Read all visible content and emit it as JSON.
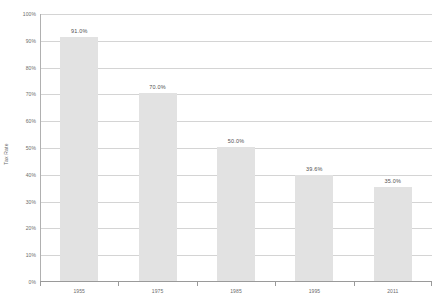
{
  "chart_data": {
    "type": "bar",
    "title": "",
    "subtitle": "",
    "xlabel": "",
    "ylabel": "Tax Rate",
    "categories": [
      "1955",
      "1975",
      "1985",
      "1995",
      "2011"
    ],
    "values": [
      91.0,
      70.0,
      50.0,
      39.6,
      35.0
    ],
    "data_labels": [
      "91.0%",
      "70.0%",
      "50.0%",
      "39.6%",
      "35.0%"
    ],
    "ylim": [
      0,
      100
    ],
    "ytick_values": [
      0,
      10,
      20,
      30,
      40,
      50,
      60,
      70,
      80,
      90,
      100
    ],
    "ytick_labels": [
      "0%",
      "10%",
      "20%",
      "30%",
      "40%",
      "50%",
      "60%",
      "70%",
      "80%",
      "90%",
      "100%"
    ],
    "grid": true,
    "legend": false,
    "legend_position": "none",
    "series": [
      {
        "name": "Tax Rate",
        "values": [
          91.0,
          70.0,
          50.0,
          39.6,
          35.0
        ]
      }
    ],
    "colors": {
      "bar_fill": "#e2e2e2",
      "gridline": "#d4d4d4",
      "axis_line": "#9a9a9a",
      "tick_text": "#6b6b6b",
      "label_text": "#4f4f4f",
      "background": "#ffffff"
    }
  }
}
